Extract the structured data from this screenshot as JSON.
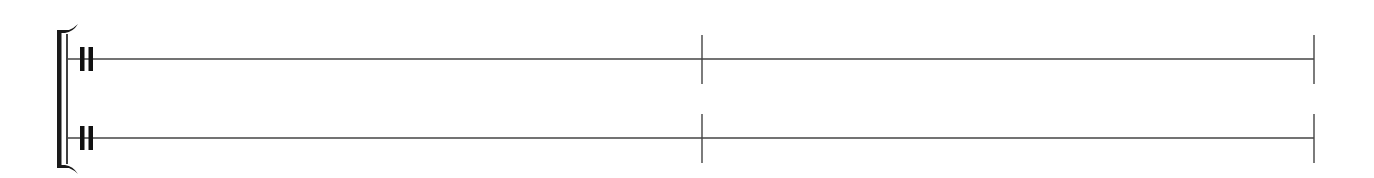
{
  "score": {
    "type": "percussion-score",
    "system": {
      "bracket": {
        "x": 59,
        "top": 30,
        "bottom": 168,
        "color": "#1a1a1a"
      },
      "system_line_x": 67,
      "end_x": 1314
    },
    "staves": [
      {
        "name": "staff-1",
        "line_y": 59,
        "lines": 1,
        "clef": "percussion",
        "barline_extent": [
          35,
          84
        ]
      },
      {
        "name": "staff-2",
        "line_y": 138,
        "lines": 1,
        "clef": "percussion",
        "barline_extent": [
          114,
          163
        ]
      }
    ],
    "measures": [
      {
        "number": 1,
        "start_x": 67,
        "end_x": 702,
        "content": "empty"
      },
      {
        "number": 2,
        "start_x": 702,
        "end_x": 1314,
        "content": "empty"
      }
    ],
    "barlines_x": [
      702,
      1314
    ],
    "colors": {
      "line": "#444444",
      "ink": "#111111",
      "background": "#ffffff"
    }
  }
}
